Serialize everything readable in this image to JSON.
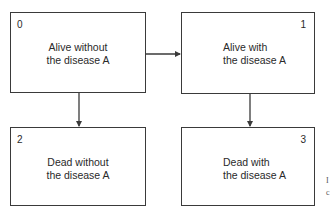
{
  "diagram": {
    "type": "state-transition",
    "states": [
      {
        "id": "0",
        "number": "0",
        "line1": "Alive without",
        "line2": "the disease A"
      },
      {
        "id": "1",
        "number": "1",
        "line1": "Alive with",
        "line2": "the disease A"
      },
      {
        "id": "2",
        "number": "2",
        "line1": "Dead without",
        "line2": "the disease A"
      },
      {
        "id": "3",
        "number": "3",
        "line1": "Dead with",
        "line2": "the disease A"
      }
    ],
    "transitions": [
      {
        "from": "0",
        "to": "1"
      },
      {
        "from": "0",
        "to": "2"
      },
      {
        "from": "1",
        "to": "3"
      }
    ],
    "edge_fragments": [
      "I",
      "c"
    ],
    "colors": {
      "line": "#3a3a3a",
      "text": "#2a2a2a",
      "background": "#ffffff"
    }
  }
}
